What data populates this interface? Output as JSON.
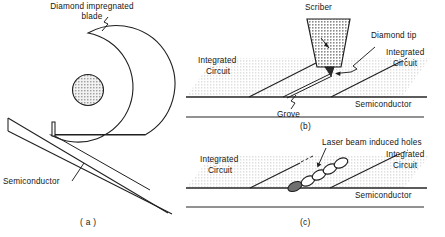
{
  "figure": {
    "background_color": "#ffffff",
    "ink_color": "#1a1a1a",
    "shade_color": "#d0d0d0",
    "scriber_fill": "#a8a8a8",
    "hub_fill": "#b5b5b5"
  },
  "panels": [
    {
      "id": "a",
      "caption": "( a )",
      "name": "diamond-blade-sawing",
      "labels": [
        {
          "name": "blade-label-line1",
          "text": "Diamond impregnated"
        },
        {
          "name": "blade-label-line2",
          "text": "blade"
        },
        {
          "name": "semiconductor-label",
          "text": "Semiconductor"
        }
      ]
    },
    {
      "id": "b",
      "caption": "(b)",
      "name": "diamond-scribing",
      "labels": [
        {
          "name": "scriber-label",
          "text": "Scriber"
        },
        {
          "name": "diamond-tip-label",
          "text": "Diamond tip"
        },
        {
          "name": "integrated-circuit-left-line1",
          "text": "Integrated"
        },
        {
          "name": "integrated-circuit-left-line2",
          "text": "Circuit"
        },
        {
          "name": "integrated-circuit-right-line1",
          "text": "Integrated"
        },
        {
          "name": "integrated-circuit-right-line2",
          "text": "Circuit"
        },
        {
          "name": "semiconductor-label",
          "text": "Semiconductor"
        },
        {
          "name": "grove-label",
          "text": "Grove"
        }
      ]
    },
    {
      "id": "c",
      "caption": "(c)",
      "name": "laser-scribing",
      "labels": [
        {
          "name": "laser-holes-label",
          "text": "Laser beam induced holes"
        },
        {
          "name": "integrated-circuit-left-line1",
          "text": "Integrated"
        },
        {
          "name": "integrated-circuit-left-line2",
          "text": "Circuit"
        },
        {
          "name": "integrated-circuit-right-line1",
          "text": "Integrated"
        },
        {
          "name": "integrated-circuit-right-line2",
          "text": "Circuit"
        },
        {
          "name": "semiconductor-label",
          "text": "Semiconductor"
        }
      ]
    }
  ],
  "text": {
    "diamond_impregnated": "Diamond impregnated",
    "blade": "blade",
    "semiconductor": "Semiconductor",
    "scriber": "Scriber",
    "diamond_tip": "Diamond tip",
    "integrated": "Integrated",
    "circuit": "Circuit",
    "grove": "Grove",
    "laser_holes": "Laser beam induced holes",
    "cap_a": "( a )",
    "cap_b": "(b)",
    "cap_c": "(c)"
  }
}
